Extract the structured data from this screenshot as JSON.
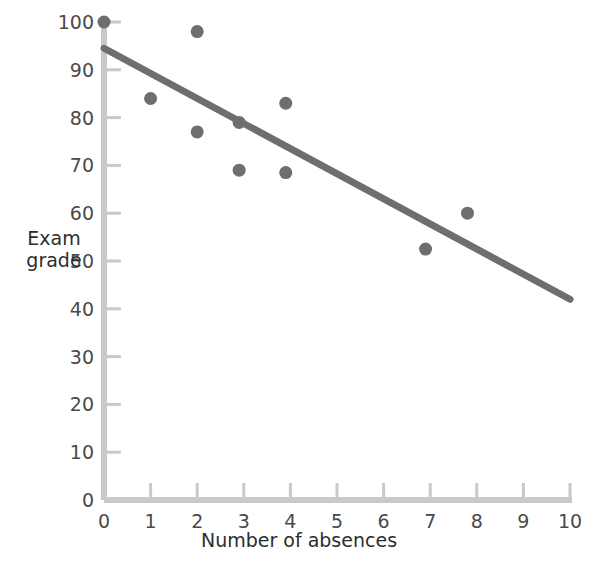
{
  "chart_data": {
    "type": "scatter",
    "title": "",
    "xlabel": "Number of absences",
    "ylabel": "Exam grade",
    "xlim": [
      0,
      10
    ],
    "ylim": [
      0,
      100
    ],
    "grid": false,
    "legend": null,
    "xticks": [
      "0",
      "1",
      "2",
      "3",
      "4",
      "5",
      "6",
      "7",
      "8",
      "9",
      "10"
    ],
    "yticks": [
      "0",
      "10",
      "20",
      "30",
      "40",
      "50",
      "60",
      "70",
      "80",
      "90",
      "100"
    ],
    "points": [
      {
        "x": 0.0,
        "y": 100
      },
      {
        "x": 1.0,
        "y": 84
      },
      {
        "x": 2.0,
        "y": 98
      },
      {
        "x": 2.0,
        "y": 77
      },
      {
        "x": 2.9,
        "y": 79
      },
      {
        "x": 2.9,
        "y": 69
      },
      {
        "x": 3.9,
        "y": 83
      },
      {
        "x": 3.9,
        "y": 68.5
      },
      {
        "x": 6.9,
        "y": 52.5
      },
      {
        "x": 7.8,
        "y": 60
      }
    ],
    "trend_line": {
      "x0": 0,
      "y0": 94.5,
      "x1": 10,
      "y1": 42
    },
    "colors": {
      "point": "#6e6e6e",
      "line": "#6e6e6e",
      "axis": "#c9c9c9",
      "text": "#3b3b3b"
    }
  }
}
